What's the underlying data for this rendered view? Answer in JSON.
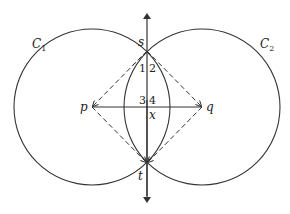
{
  "diagram": {
    "type": "geometric-construction",
    "circles": [
      {
        "id": "C1",
        "label": "C",
        "subscript": "1",
        "center": "p"
      },
      {
        "id": "C2",
        "label": "C",
        "subscript": "2",
        "center": "q"
      }
    ],
    "points": {
      "s": "s",
      "t": "t",
      "p": "p",
      "q": "q",
      "x": "x"
    },
    "angle_labels": [
      "1",
      "2",
      "3",
      "4"
    ],
    "lines": [
      {
        "from": "s",
        "to": "t",
        "style": "solid",
        "arrows": "both",
        "extended": true
      },
      {
        "from": "p",
        "to": "q",
        "style": "solid"
      },
      {
        "from": "s",
        "to": "p",
        "style": "dashed"
      },
      {
        "from": "s",
        "to": "q",
        "style": "dashed"
      },
      {
        "from": "t",
        "to": "p",
        "style": "dashed"
      },
      {
        "from": "t",
        "to": "q",
        "style": "dashed"
      }
    ],
    "colors": {
      "stroke": "#333333",
      "background": "#ffffff"
    }
  }
}
